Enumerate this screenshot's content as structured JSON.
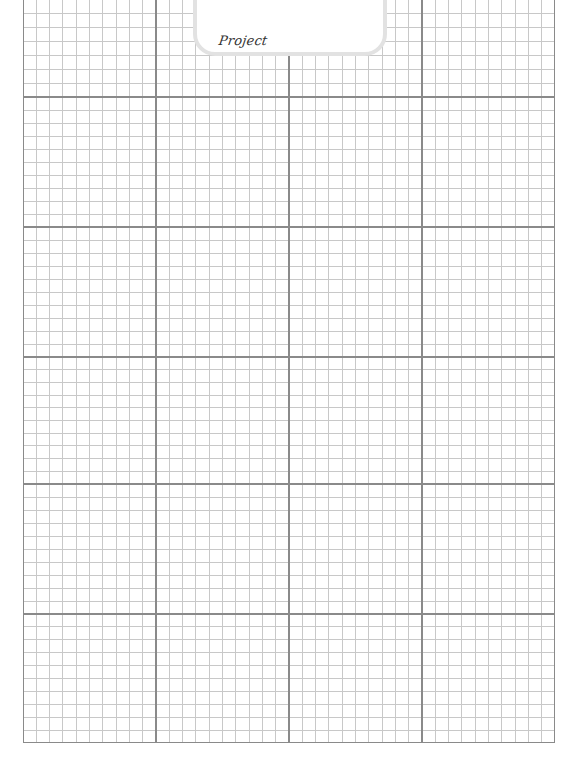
{
  "page": {
    "type": "graph-paper",
    "background_color": "#ffffff"
  },
  "tab": {
    "label": "Project",
    "border_color": "#e2e2e2"
  },
  "grid": {
    "columns_major": 4,
    "rows_major": 6,
    "minor_per_major_x": 10,
    "minor_per_major_y": 10,
    "minor_line_color": "#c8c8c8",
    "major_line_color": "#8a8a8a",
    "border_color": "#8a8a8a"
  }
}
